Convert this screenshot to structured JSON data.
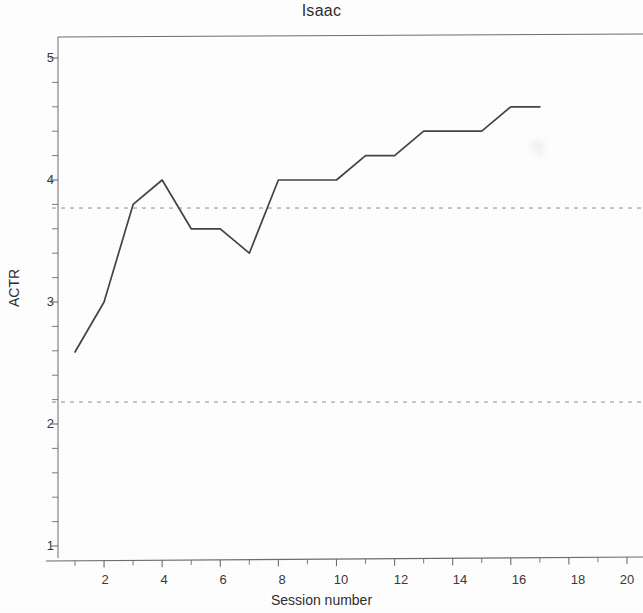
{
  "chart_data": {
    "type": "line",
    "title": "Isaac",
    "xlabel": "Session number",
    "ylabel": "ACTR",
    "x": [
      1,
      2,
      3,
      4,
      5,
      6,
      7,
      8,
      9,
      10,
      11,
      12,
      13,
      14,
      15,
      16,
      17
    ],
    "values": [
      2.59,
      3.0,
      3.8,
      4.0,
      3.6,
      3.6,
      3.4,
      4.0,
      4.0,
      4.0,
      4.2,
      4.2,
      4.4,
      4.4,
      4.4,
      4.6,
      4.6
    ],
    "series": [
      {
        "name": "ACTR",
        "values": [
          2.59,
          3.0,
          3.8,
          4.0,
          3.6,
          3.6,
          3.4,
          4.0,
          4.0,
          4.0,
          4.2,
          4.2,
          4.4,
          4.4,
          4.4,
          4.6,
          4.6
        ]
      }
    ],
    "xlim": [
      1,
      20
    ],
    "ylim": [
      1,
      5.2
    ],
    "xticks": [
      1,
      2,
      3,
      4,
      5,
      6,
      7,
      8,
      9,
      10,
      11,
      12,
      13,
      14,
      15,
      16,
      17,
      18,
      19,
      20
    ],
    "xtick_labels": [
      "",
      "2",
      "",
      "4",
      "",
      "6",
      "",
      "8",
      "",
      "10",
      "",
      "12",
      "",
      "14",
      "",
      "16",
      "",
      "18",
      "",
      "20"
    ],
    "yticks": [
      1,
      1.2,
      1.4,
      1.6,
      1.8,
      2,
      2.2,
      2.4,
      2.6,
      2.8,
      3,
      3.2,
      3.4,
      3.6,
      3.8,
      4,
      4.2,
      4.4,
      4.6,
      4.8,
      5
    ],
    "ytick_labels": [
      "1",
      "",
      "",
      "",
      "",
      "2",
      "",
      "",
      "",
      "",
      "3",
      "",
      "",
      "",
      "",
      "4",
      "",
      "",
      "",
      "",
      "5"
    ],
    "reference_lines": [
      {
        "name": "upper-criterion",
        "value": 3.77,
        "style": "dashed"
      },
      {
        "name": "lower-criterion",
        "value": 2.18,
        "style": "dashed"
      }
    ],
    "grid": false,
    "legend": null,
    "line_color": "#444444"
  },
  "axis": {
    "y_labels": [
      "5",
      "4",
      "3",
      "2",
      "1"
    ],
    "x_labels": [
      "2",
      "4",
      "6",
      "8",
      "10",
      "12",
      "14",
      "16",
      "18",
      "20"
    ]
  }
}
